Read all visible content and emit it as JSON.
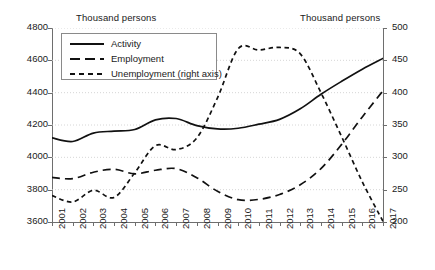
{
  "header": {
    "left_axis_unit": "Thousand persons",
    "right_axis_unit": "Thousand persons"
  },
  "legend": {
    "entries": [
      {
        "label": "Activity",
        "style": "solid",
        "color": "#111111"
      },
      {
        "label": "Employment",
        "style": "dashed",
        "color": "#111111"
      },
      {
        "label": "Unemployment (right axis)",
        "style": "dotted",
        "color": "#111111"
      }
    ]
  },
  "axes": {
    "left_ticks": [
      "4800",
      "4600",
      "4400",
      "4200",
      "4000",
      "3800",
      "3600"
    ],
    "right_ticks": [
      "500",
      "450",
      "400",
      "350",
      "300",
      "250",
      "200"
    ],
    "x_ticks": [
      "2001",
      "2002",
      "2003",
      "2004",
      "2005",
      "2006",
      "2007",
      "2008",
      "2009",
      "2010",
      "2011",
      "2012",
      "2013",
      "2014",
      "2015",
      "2016",
      "2017"
    ]
  },
  "chart_data": {
    "type": "line",
    "title": "",
    "xlabel": "",
    "ylabel": "Thousand persons",
    "y2label": "Thousand persons",
    "ylim": [
      3600,
      4800
    ],
    "y2lim": [
      200,
      500
    ],
    "grid": true,
    "legend_position": "top-left",
    "x": [
      2001,
      2002,
      2003,
      2004,
      2005,
      2006,
      2007,
      2008,
      2009,
      2010,
      2011,
      2012,
      2013,
      2014,
      2015,
      2016,
      2017
    ],
    "series": [
      {
        "name": "Activity",
        "axis": "left",
        "style": "solid",
        "values": [
          4120,
          4098,
          4150,
          4162,
          4172,
          4232,
          4240,
          4196,
          4176,
          4180,
          4205,
          4235,
          4300,
          4390,
          4470,
          4545,
          4612
        ]
      },
      {
        "name": "Employment",
        "axis": "left",
        "style": "dashed",
        "values": [
          3876,
          3868,
          3908,
          3926,
          3898,
          3920,
          3930,
          3874,
          3790,
          3738,
          3740,
          3770,
          3830,
          3930,
          4080,
          4250,
          4412
        ]
      },
      {
        "name": "Unemployment (right axis)",
        "axis": "right",
        "style": "dotted",
        "values": [
          241,
          231,
          249,
          238,
          276,
          318,
          312,
          330,
          392,
          468,
          466,
          470,
          460,
          400,
          332,
          262,
          201
        ]
      }
    ]
  }
}
